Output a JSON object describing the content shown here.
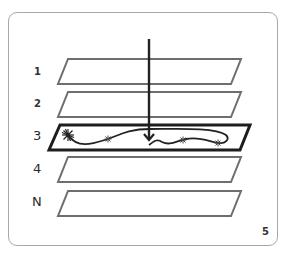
{
  "diagram": {
    "type": "layered-planes",
    "layers": [
      {
        "label": "1",
        "highlighted": false
      },
      {
        "label": "2",
        "highlighted": false
      },
      {
        "label": "3",
        "highlighted": true
      },
      {
        "label": "4",
        "highlighted": false
      },
      {
        "label": "N",
        "highlighted": false
      }
    ],
    "arrow": {
      "direction": "down",
      "target_layer": "3"
    },
    "path_markers": [
      "starburst",
      "star",
      "star",
      "star"
    ],
    "colors": {
      "plane_stroke": "#6e6e6e",
      "highlight_stroke": "#1e1e1e",
      "arrow": "#222222",
      "frame": "#a8a8a8"
    }
  },
  "page": {
    "number": "5"
  }
}
